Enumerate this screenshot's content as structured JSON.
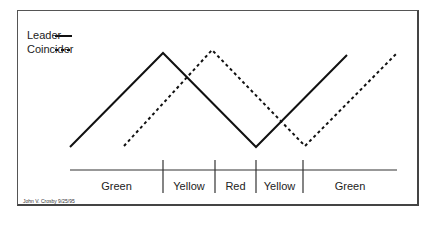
{
  "legend": [
    {
      "label": "Leader",
      "style": "solid"
    },
    {
      "label": "Coincider",
      "style": "dashed"
    }
  ],
  "zones": [
    {
      "label": "Green",
      "x0": 70,
      "x1": 163
    },
    {
      "label": "Yellow",
      "x0": 163,
      "x1": 215
    },
    {
      "label": "Red",
      "x0": 215,
      "x1": 256
    },
    {
      "label": "Yellow",
      "x0": 256,
      "x1": 303
    },
    {
      "label": "Green",
      "x0": 303,
      "x1": 397
    }
  ],
  "credit": "John V. Crosby   9/25/95",
  "series": {
    "leader": [
      [
        70,
        147
      ],
      [
        163,
        53
      ],
      [
        256,
        147
      ],
      [
        347,
        55
      ]
    ],
    "coincider": [
      [
        124,
        146
      ],
      [
        212,
        50
      ],
      [
        305,
        146
      ],
      [
        397,
        53
      ]
    ]
  }
}
